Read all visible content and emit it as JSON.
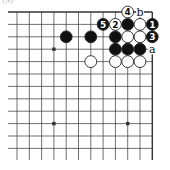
{
  "diagram": {
    "caption": "(9)",
    "board": {
      "columns": 12,
      "rows": 12,
      "origin_x": 17,
      "origin_y": 12,
      "spacing_x": 12.3,
      "spacing_y": 12.4,
      "top_edge": true,
      "right_edge": true,
      "hoshi": [
        [
          3,
          3
        ],
        [
          3,
          9
        ],
        [
          9,
          9
        ]
      ]
    },
    "stones": [
      {
        "col": 4,
        "row": 2,
        "color": "black",
        "label": ""
      },
      {
        "col": 6,
        "row": 2,
        "color": "black",
        "label": ""
      },
      {
        "col": 6,
        "row": 4,
        "color": "white",
        "label": ""
      },
      {
        "col": 7,
        "row": 1,
        "color": "black",
        "label": "5"
      },
      {
        "col": 8,
        "row": 1,
        "color": "white",
        "label": "2"
      },
      {
        "col": 9,
        "row": 0,
        "color": "white",
        "label": "4"
      },
      {
        "col": 9,
        "row": 1,
        "color": "black",
        "label": ""
      },
      {
        "col": 10,
        "row": 1,
        "color": "white",
        "label": ""
      },
      {
        "col": 11,
        "row": 1,
        "color": "black",
        "label": "1"
      },
      {
        "col": 8,
        "row": 2,
        "color": "black",
        "label": ""
      },
      {
        "col": 9,
        "row": 2,
        "color": "white",
        "label": ""
      },
      {
        "col": 10,
        "row": 2,
        "color": "white",
        "label": ""
      },
      {
        "col": 11,
        "row": 2,
        "color": "black",
        "label": "3"
      },
      {
        "col": 8,
        "row": 3,
        "color": "black",
        "label": ""
      },
      {
        "col": 9,
        "row": 3,
        "color": "black",
        "label": ""
      },
      {
        "col": 10,
        "row": 3,
        "color": "black",
        "label": ""
      },
      {
        "col": 8,
        "row": 4,
        "color": "white",
        "label": ""
      },
      {
        "col": 9,
        "row": 4,
        "color": "white",
        "label": ""
      },
      {
        "col": 10,
        "row": 4,
        "color": "white",
        "label": ""
      }
    ],
    "point_labels": [
      {
        "col": 10,
        "row": 0,
        "text": "b"
      },
      {
        "col": 11,
        "row": 3,
        "text": "a"
      }
    ],
    "colors": {
      "line": "#333333",
      "black_stone": "#111111",
      "white_stone": "#ffffff",
      "stone_outline": "#222222"
    }
  }
}
